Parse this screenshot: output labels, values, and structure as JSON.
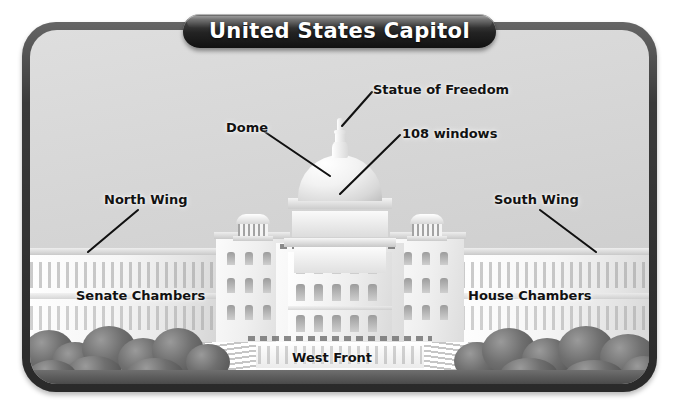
{
  "banner": {
    "title": "United States Capitol"
  },
  "diagram": {
    "subject": "United States Capitol",
    "labels": [
      {
        "id": "statue-of-freedom",
        "text": "Statue of Freedom",
        "x": 372,
        "y": 84
      },
      {
        "id": "dome",
        "text": "Dome",
        "x": 228,
        "y": 120
      },
      {
        "id": "108-windows",
        "text": "108 windows",
        "x": 404,
        "y": 128
      },
      {
        "id": "north-wing",
        "text": "North Wing",
        "x": 106,
        "y": 192
      },
      {
        "id": "south-wing",
        "text": "South Wing",
        "x": 496,
        "y": 192
      },
      {
        "id": "senate-chambers",
        "text": "Senate Chambers",
        "x": 78,
        "y": 288
      },
      {
        "id": "house-chambers",
        "text": "House Chambers",
        "x": 470,
        "y": 288
      },
      {
        "id": "west-front",
        "text": "West Front",
        "x": 294,
        "y": 350
      }
    ],
    "colors": {
      "frame": "#3a3a3a",
      "sky": "#d6d6d6",
      "stone": "#f2f2f2",
      "foliage": "#5a5a5a",
      "label_text": "#121212",
      "banner_text": "#ffffff"
    }
  }
}
